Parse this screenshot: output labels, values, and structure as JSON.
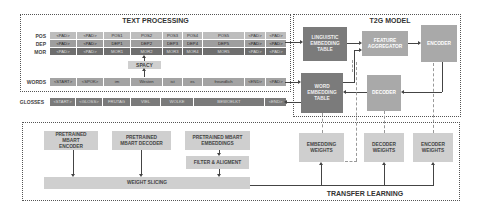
{
  "text_processing": {
    "title": "TEXT PROCESSING",
    "rows": {
      "pos": {
        "label": "POS",
        "cells": [
          "<PAD>",
          "<PAD>",
          "POS1",
          "POS2",
          "POS3",
          "POS4",
          "POS5",
          "<PAD>",
          "<PAD>"
        ]
      },
      "dep": {
        "label": "DEP",
        "cells": [
          "<PAD>",
          "<PAD>",
          "DEP1",
          "DEP2",
          "DEP3",
          "DEP4",
          "DEP5",
          "<PAD>",
          "<PAD>"
        ]
      },
      "mor": {
        "label": "MOR",
        "cells": [
          "<PAD>",
          "<PAD>",
          "MOR1",
          "MOR2",
          "MOR3",
          "MOR4",
          "MOR5",
          "<PAD>",
          "<PAD>"
        ]
      },
      "words": {
        "label": "WORDS",
        "cells": [
          "<START>",
          "<SPOK>",
          "im",
          "Westen",
          "ist",
          "es",
          "freundlich",
          "<END>",
          "<PAD>"
        ]
      }
    },
    "spacy_label": "SPACY"
  },
  "glosses": {
    "label": "GLOSSES",
    "cells": [
      "<START>",
      "<GLOSS>",
      "FRUTAG",
      "VIEL",
      "WOLKE",
      "BEWOELKT",
      "<END>"
    ]
  },
  "t2g_model": {
    "title": "T2G MODEL",
    "linguistic_embedding_table": "LINGUISTIC EMBEDDING TABLE",
    "feature_aggregator": "FEATURE AGGREGATOR",
    "encoder": "ENCODER",
    "word_embedding_table": "WORD EMBEDDING TABLE",
    "decoder": "DECODER"
  },
  "transfer_learning": {
    "title": "TRANSFER LEARNING",
    "pretrained_encoder": "PRETRAINED MBART ENCODER",
    "pretrained_decoder": "PRETRAINED MBART DECODER",
    "pretrained_embeddings": "PRETRAINED MBART EMBEDDINGS",
    "filter_alignment": "FILTER & ALIGMENT",
    "weight_slicing": "WEIGHT SLICING",
    "embedding_weights": "EMBEDDING WEIGHTS",
    "decoder_weights": "DECODER WEIGHTS",
    "encoder_weights": "ENCODER WEIGHTS"
  },
  "colors": {
    "dark_box": "#7b7b7b",
    "mid_box": "#a9a9a9",
    "light_box": "#cfcfcf",
    "border": "#555555"
  }
}
